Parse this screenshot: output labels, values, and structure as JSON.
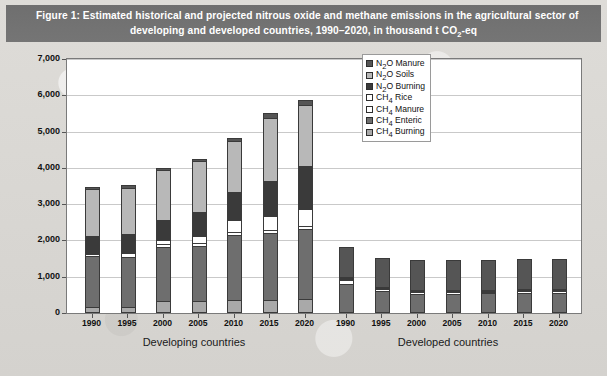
{
  "figure": {
    "title_line1": "Figure 1: Estimated historical and projected nitrous oxide and methane emissions in the agricultural sector of",
    "title_line2_a": "developing and developed countries, 1990–2020, in thousand t CO",
    "title_line2_sub": "2",
    "title_line2_b": "-eq"
  },
  "legend": {
    "items": [
      {
        "label_a": "N",
        "sub": "2",
        "label_b": "O Manure",
        "color": "#555555"
      },
      {
        "label_a": "N",
        "sub": "2",
        "label_b": "O Soils",
        "color": "#b8b8b8"
      },
      {
        "label_a": "N",
        "sub": "2",
        "label_b": "O Burning",
        "color": "#3a3a3a"
      },
      {
        "label_a": "CH",
        "sub": "4",
        "label_b": " Rice",
        "color": "#ffffff"
      },
      {
        "label_a": "CH",
        "sub": "4",
        "label_b": " Manure",
        "color": "#ffffff"
      },
      {
        "label_a": "CH",
        "sub": "4",
        "label_b": " Enteric",
        "color": "#6e6e6e"
      },
      {
        "label_a": "CH",
        "sub": "4",
        "label_b": " Burning",
        "color": "#a9a9a9"
      }
    ]
  },
  "axis": {
    "y_ticks": [
      "7,000",
      "6,000",
      "5,000",
      "4,000",
      "3,000",
      "2,000",
      "1,000",
      "0"
    ],
    "y_min": 0,
    "y_max": 7000,
    "group_labels": [
      "Developing countries",
      "Developed countries"
    ]
  },
  "chart_data": {
    "type": "bar",
    "stacked": true,
    "title": "Estimated historical and projected nitrous oxide and methane emissions in the agricultural sector of developing and developed countries, 1990–2020, in thousand t CO2-eq",
    "xlabel": "",
    "ylabel": "thousand t CO2-eq",
    "ylim": [
      0,
      7000
    ],
    "ytick_step": 1000,
    "grid": true,
    "legend_position": "top-right-inside",
    "groups": [
      "Developing countries",
      "Developed countries"
    ],
    "categories": [
      "1990",
      "1995",
      "2000",
      "2005",
      "2010",
      "2015",
      "2020"
    ],
    "stack_order_bottom_to_top": [
      "CH4 Burning",
      "CH4 Enteric",
      "CH4 Manure",
      "CH4 Rice",
      "N2O Burning",
      "N2O Soils",
      "N2O Manure"
    ],
    "series": [
      {
        "group": "Developing countries",
        "stacks": [
          {
            "name": "CH4 Burning",
            "color": "#a9a9a9",
            "values": [
              130,
              130,
              320,
              320,
              330,
              330,
              350
            ]
          },
          {
            "name": "CH4 Enteric",
            "color": "#6e6e6e",
            "values": [
              1430,
              1420,
              1500,
              1520,
              1830,
              1870,
              1950
            ]
          },
          {
            "name": "CH4 Manure",
            "color": "#ffffff",
            "values": [
              60,
              100,
              80,
              90,
              70,
              80,
              90
            ]
          },
          {
            "name": "CH4 Rice",
            "color": "#ffffff",
            "values": [
              0,
              0,
              110,
              200,
              330,
              400,
              480
            ]
          },
          {
            "name": "N2O Burning",
            "color": "#3a3a3a",
            "values": [
              500,
              530,
              570,
              650,
              780,
              960,
              1200
            ]
          },
          {
            "name": "N2O Soils",
            "color": "#b8b8b8",
            "values": [
              1320,
              1300,
              1380,
              1430,
              1430,
              1760,
              1680
            ]
          },
          {
            "name": "N2O Manure",
            "color": "#555555",
            "values": [
              40,
              40,
              40,
              40,
              40,
              110,
              110
            ]
          }
        ],
        "totals": [
          3480,
          3520,
          4000,
          4250,
          4810,
          5510,
          5860
        ]
      },
      {
        "group": "Developed countries",
        "stacks": [
          {
            "name": "CH4 Burning",
            "color": "#a9a9a9",
            "values": [
              0,
              0,
              0,
              0,
              0,
              0,
              0
            ]
          },
          {
            "name": "CH4 Enteric",
            "color": "#6e6e6e",
            "values": [
              800,
              600,
              520,
              530,
              540,
              560,
              560
            ]
          },
          {
            "name": "CH4 Manure",
            "color": "#ffffff",
            "values": [
              100,
              60,
              50,
              40,
              40,
              40,
              40
            ]
          },
          {
            "name": "CH4 Rice",
            "color": "#ffffff",
            "values": [
              40,
              30,
              30,
              20,
              20,
              20,
              20
            ]
          },
          {
            "name": "N2O Burning",
            "color": "#3a3a3a",
            "values": [
              40,
              30,
              30,
              30,
              30,
              30,
              30
            ]
          },
          {
            "name": "N2O Soils",
            "color": "#b8b8b8",
            "values": [
              0,
              0,
              0,
              0,
              0,
              0,
              0
            ]
          },
          {
            "name": "N2O Manure",
            "color": "#555555",
            "values": [
              840,
              790,
              840,
              850,
              840,
              840,
              830
            ]
          }
        ],
        "totals": [
          1820,
          1510,
          1470,
          1470,
          1470,
          1490,
          1480
        ]
      }
    ]
  }
}
